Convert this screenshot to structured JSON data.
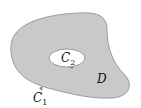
{
  "diagram": {
    "region_label": "D",
    "outer_curve": {
      "name": "C",
      "subscript": "1"
    },
    "inner_curve": {
      "name": "C",
      "subscript": "2"
    },
    "colors": {
      "region_fill": "#c9c9c9",
      "boundary_stroke": "#9a9a9a",
      "hole_fill": "#ffffff",
      "arrow": "#8a8a8a"
    }
  }
}
